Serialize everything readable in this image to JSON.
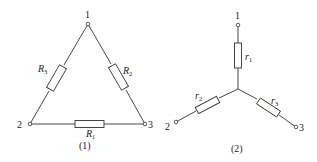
{
  "figure1": {
    "caption": "(1)",
    "type": "delta",
    "nodes": [
      {
        "label": "1",
        "x": 88,
        "y": 24
      },
      {
        "label": "2",
        "x": 30,
        "y": 124
      },
      {
        "label": "3",
        "x": 145,
        "y": 124
      }
    ],
    "resistors": [
      {
        "name": "R",
        "sub": "1",
        "between": [
          "2",
          "3"
        ]
      },
      {
        "name": "R",
        "sub": "2",
        "between": [
          "1",
          "3"
        ]
      },
      {
        "name": "R",
        "sub": "3",
        "between": [
          "1",
          "2"
        ]
      }
    ]
  },
  "figure2": {
    "caption": "(2)",
    "type": "star",
    "nodes": [
      {
        "label": "1",
        "x": 238,
        "y": 25
      },
      {
        "label": "2",
        "x": 176,
        "y": 122
      },
      {
        "label": "3",
        "x": 296,
        "y": 127
      }
    ],
    "resistors": [
      {
        "name": "r",
        "sub": "1",
        "between": [
          "1",
          "center"
        ]
      },
      {
        "name": "r",
        "sub": "2",
        "between": [
          "2",
          "center"
        ]
      },
      {
        "name": "r",
        "sub": "3",
        "between": [
          "3",
          "center"
        ]
      }
    ]
  }
}
